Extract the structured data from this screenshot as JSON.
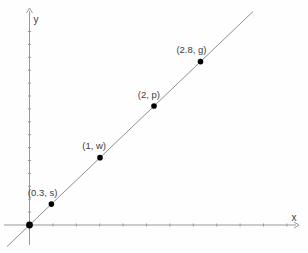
{
  "figure": {
    "background": "#fefefe",
    "axis_color": "#999999",
    "line_color": "#8f8f8f",
    "point_color": "#000000",
    "label_color": "#3d3d3d"
  },
  "chart_data": {
    "type": "scatter",
    "title": "",
    "xlabel": "x",
    "ylabel": "y",
    "grid": false,
    "axis_ticks_labeled": false,
    "line": {
      "shape": "straight line through the origin with positive slope",
      "passes_through_origin": true
    },
    "has_origin_point": true,
    "points": [
      {
        "x": 0.3,
        "y": "s",
        "label": "(0.3, s)"
      },
      {
        "x": 1,
        "y": "w",
        "label": "(1, w)"
      },
      {
        "x": 2,
        "y": "p",
        "label": "(2, p)"
      },
      {
        "x": 2.8,
        "y": "g",
        "label": "(2.8, g)"
      }
    ],
    "layout": {
      "origin_px": [
        29.5,
        225
      ],
      "line_px": [
        [
          7,
          246.5
        ],
        [
          253,
          11.5
        ]
      ],
      "point_px_x": [
        51.4,
        100,
        154,
        200.5
      ],
      "x_axis_y_px": 225,
      "y_axis_x_px": 29.5,
      "x_axis_range_px": [
        4,
        299
      ],
      "y_axis_range_px": [
        8,
        245
      ],
      "x_tick_spacing_px": 23.4,
      "x_tick_count": 11,
      "y_tick_spacing_px": 12.9,
      "y_tick_count": 15,
      "point_radius_px": 2.8,
      "origin_radius_px": 3.4
    }
  }
}
